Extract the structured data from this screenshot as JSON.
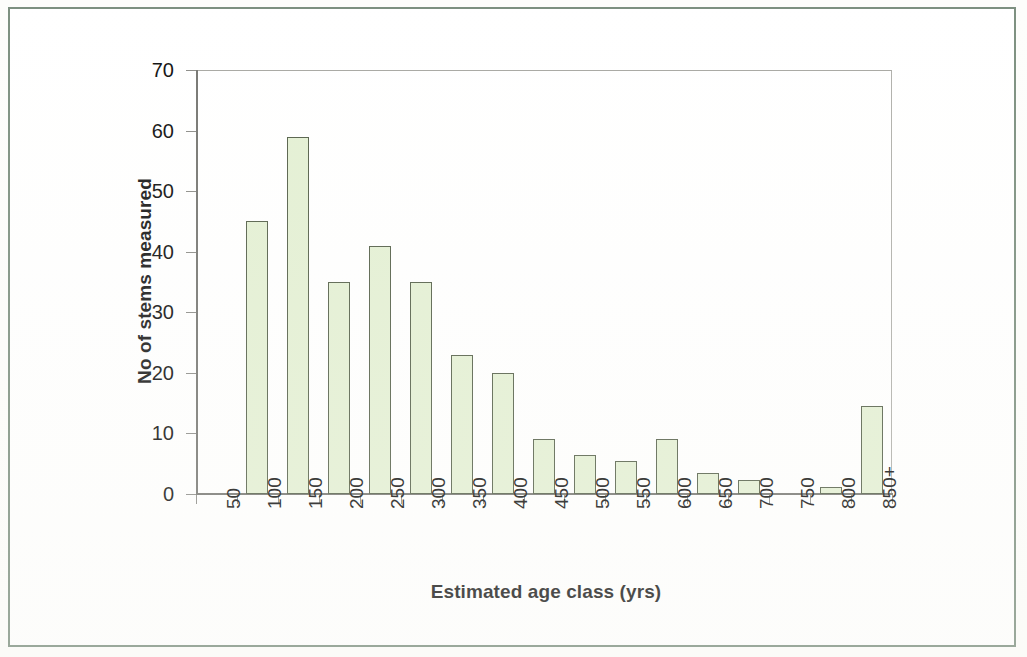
{
  "figure": {
    "frame_color": "#7d9080",
    "background": "#ffffff"
  },
  "chart_data": {
    "type": "bar",
    "title": "",
    "xlabel": "Estimated age class (yrs)",
    "ylabel": "No of stems measured",
    "categories": [
      "50",
      "100",
      "150",
      "200",
      "250",
      "300",
      "350",
      "400",
      "450",
      "500",
      "550",
      "600",
      "650",
      "700",
      "750",
      "800",
      "850+"
    ],
    "values": [
      0,
      45,
      59,
      35,
      41,
      35,
      23,
      20,
      9,
      6.5,
      5.5,
      9,
      3.5,
      2.3,
      0,
      1.2,
      14.5
    ],
    "ylim": [
      0,
      70
    ],
    "yticks": [
      0,
      10,
      20,
      30,
      40,
      50,
      60,
      70
    ],
    "ytick_labels": [
      "0",
      "10",
      "20",
      "30",
      "40",
      "50",
      "60",
      "70"
    ],
    "xlim_note": "category axis, one tick per class",
    "grid": false,
    "legend": null,
    "bar_fill_color": "#e4f0d4",
    "bar_edge_color": "#55604a",
    "axis_color": "#777773"
  }
}
